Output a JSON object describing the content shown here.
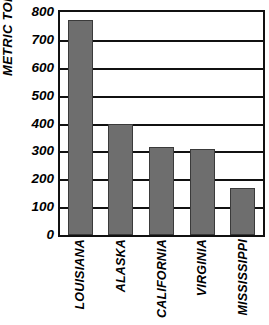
{
  "chart_data": {
    "type": "bar",
    "title": "",
    "subtitle": "",
    "xlabel": "",
    "ylabel": "METRIC TONS",
    "categories": [
      "LOUISIANA",
      "ALASKA",
      "CALIFORNIA",
      "VIRGINIA",
      "MISSISSIPPI"
    ],
    "values": [
      772,
      398,
      317,
      310,
      168
    ],
    "ylim": [
      0,
      800
    ],
    "ytick_step": 100,
    "ytick_labels": [
      "800",
      "700",
      "600",
      "500",
      "400",
      "300",
      "200",
      "100",
      "0"
    ],
    "ytick_values": [
      800,
      700,
      600,
      500,
      400,
      300,
      200,
      100,
      0
    ],
    "grid": true,
    "grid_axis": "y",
    "legend": false,
    "legend_position": "none",
    "bar_color": "#6e6e6e",
    "bar_edge_color": "#3a3a3a",
    "axis_color": "#111111",
    "background_color": "#ffffff",
    "text_color": "#000000"
  }
}
